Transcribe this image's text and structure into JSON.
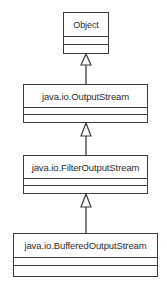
{
  "diagram": {
    "type": "uml-class-diagram",
    "background_color": "#ffffff",
    "line_color": "#3b3b3b",
    "text_color": "#2b2b2b",
    "classes": [
      {
        "id": "object",
        "name": "Object",
        "attributes": [],
        "operations": []
      },
      {
        "id": "outputstream",
        "name": "java.io.OutputStream",
        "attributes": [],
        "operations": []
      },
      {
        "id": "filteroutputstream",
        "name": "java.io.FilterOutputStream",
        "attributes": [],
        "operations": []
      },
      {
        "id": "bufferedoutputstream",
        "name": "java.io.BufferedOutputStream",
        "attributes": [],
        "operations": []
      }
    ],
    "relationships": [
      {
        "id": "gen-1",
        "type": "generalization",
        "from": "outputstream",
        "to": "object"
      },
      {
        "id": "gen-2",
        "type": "generalization",
        "from": "filteroutputstream",
        "to": "outputstream"
      },
      {
        "id": "gen-3",
        "type": "generalization",
        "from": "bufferedoutputstream",
        "to": "filteroutputstream"
      }
    ]
  }
}
